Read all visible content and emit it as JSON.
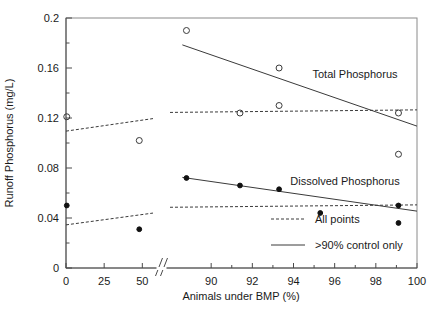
{
  "chart_data": {
    "type": "scatter",
    "title": "",
    "xlabel": "Animals under BMP (%)",
    "ylabel": "Runoff Phosphorus (mg/L)",
    "ylim": [
      0,
      0.2
    ],
    "ytick_labels": [
      "0",
      "0.04",
      "0.08",
      "0.12",
      "0.16",
      "0.2"
    ],
    "ytick_values": [
      0,
      0.04,
      0.08,
      0.12,
      0.16,
      0.2
    ],
    "yminor_values": [
      0.02,
      0.06,
      0.1,
      0.14,
      0.18
    ],
    "grid": false,
    "axis_break": {
      "present": true,
      "left_segment_range": [
        0,
        57
      ],
      "right_segment_range": [
        88,
        100
      ],
      "note": "x-axis is broken between 50-ish and 90"
    },
    "xtick_labels": [
      "0",
      "25",
      "50",
      "90",
      "92",
      "94",
      "96",
      "98",
      "100"
    ],
    "xtick_values": [
      0,
      25,
      50,
      90,
      92,
      94,
      96,
      98,
      100
    ],
    "legend_position": "inside-lower-right",
    "legend": [
      {
        "label": "All points",
        "style": "dashed"
      },
      {
        "label": ">90% control only",
        "style": "solid"
      }
    ],
    "series": [
      {
        "name": "Total Phosphorus",
        "marker": "open-circle",
        "annotation": "Total Phosphorus",
        "points": [
          {
            "x": 0.5,
            "y": 0.121
          },
          {
            "x": 48.0,
            "y": 0.102
          },
          {
            "x": 88.8,
            "y": 0.19
          },
          {
            "x": 91.4,
            "y": 0.124
          },
          {
            "x": 93.3,
            "y": 0.16
          },
          {
            "x": 93.3,
            "y": 0.13
          },
          {
            "x": 99.1,
            "y": 0.124
          },
          {
            "x": 99.1,
            "y": 0.091
          }
        ],
        "fits": [
          {
            "style": "dashed",
            "label": "All points",
            "x0": 0.0,
            "y0": 0.1095,
            "x1": 100.0,
            "y1": 0.1265
          },
          {
            "style": "solid",
            "label": ">90% control only",
            "x0": 88.6,
            "y0": 0.1785,
            "x1": 100.0,
            "y1": 0.1135
          }
        ]
      },
      {
        "name": "Dissolved Phosphorus",
        "marker": "filled-circle",
        "annotation": "Dissolved Phosphorus",
        "points": [
          {
            "x": 0.5,
            "y": 0.05
          },
          {
            "x": 48.0,
            "y": 0.031
          },
          {
            "x": 88.8,
            "y": 0.072
          },
          {
            "x": 91.4,
            "y": 0.066
          },
          {
            "x": 93.3,
            "y": 0.063
          },
          {
            "x": 95.3,
            "y": 0.044
          },
          {
            "x": 99.1,
            "y": 0.05
          },
          {
            "x": 99.1,
            "y": 0.036
          }
        ],
        "fits": [
          {
            "style": "dashed",
            "label": "All points",
            "x0": 0.0,
            "y0": 0.0345,
            "x1": 100.0,
            "y1": 0.0505
          },
          {
            "style": "solid",
            "label": ">90% control only",
            "x0": 88.6,
            "y0": 0.0725,
            "x1": 100.0,
            "y1": 0.0455
          }
        ]
      }
    ]
  },
  "annotations": {
    "total_phosphorus": "Total Phosphorus",
    "dissolved_phosphorus": "Dissolved Phosphorus"
  }
}
